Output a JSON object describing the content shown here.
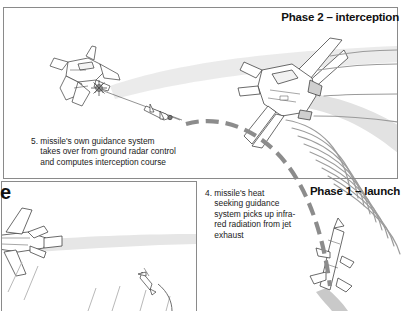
{
  "figure": {
    "type": "technical-illustration",
    "background_color": "#ffffff",
    "line_color": "#333333",
    "trail_color": "#e3e3e3",
    "dash_arc_color": "#8c8c8c",
    "radiation_arc_color": "#9a9a9a",
    "border_color": "#8a8a8a"
  },
  "panels": [
    {
      "id": "phase2",
      "title": "Phase 2 – interception",
      "title_align": "right"
    },
    {
      "id": "phase1",
      "title": "Phase 1 – launch",
      "title_align": "right"
    }
  ],
  "partial_text": {
    "left_edge_fragment": "e"
  },
  "callouts": [
    {
      "id": "callout-5",
      "number": "5.",
      "text": "5. missile's own guidance system\n    takes over from ground radar control\n    and computes interception course"
    },
    {
      "id": "callout-4",
      "number": "4.",
      "text": "4. missile's heat\n    seeking guidance\n    system picks up infra-\n    red radiation from jet\n    exhaust"
    }
  ],
  "graphics": {
    "jet_target_upper_left": "fighter-jet-struck-by-missile",
    "impact_burst": "explosion-burst",
    "jet_large_right": "fighter-jet-banking-emitting-infrared",
    "missile_climbing": "missile-ascending-with-exhaust",
    "missile_small_incoming": "missile-in-flight",
    "jet_lower_left": "fighter-jet-flying-left",
    "missile_launch_small": "missile-launching",
    "trajectory": "dashed-arc-interception-path",
    "radiation": "concentric-infrared-arcs"
  }
}
